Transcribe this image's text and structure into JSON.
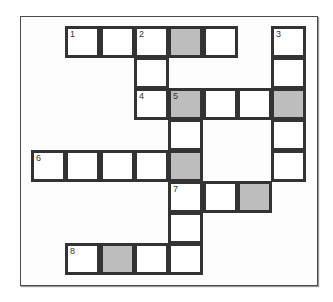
{
  "puzzle": {
    "type": "crossword",
    "colors": {
      "frame_border": "#4a4a4a",
      "cell_border": "#333333",
      "cell_fill": "#ffffff",
      "shaded_fill": "#bdbdbd"
    },
    "grid": {
      "origin_x": 31,
      "origin_y": 26,
      "cell_w": 34.3,
      "cell_h": 31,
      "cells": [
        {
          "row": 0,
          "col": 1,
          "number": "1",
          "shaded": false
        },
        {
          "row": 0,
          "col": 2,
          "number": "",
          "shaded": false
        },
        {
          "row": 0,
          "col": 3,
          "number": "2",
          "shaded": false
        },
        {
          "row": 0,
          "col": 4,
          "number": "",
          "shaded": true
        },
        {
          "row": 0,
          "col": 5,
          "number": "",
          "shaded": false
        },
        {
          "row": 0,
          "col": 7,
          "number": "3",
          "shaded": false
        },
        {
          "row": 1,
          "col": 3,
          "number": "",
          "shaded": false
        },
        {
          "row": 1,
          "col": 7,
          "number": "",
          "shaded": false
        },
        {
          "row": 2,
          "col": 3,
          "number": "4",
          "shaded": false
        },
        {
          "row": 2,
          "col": 4,
          "number": "5",
          "shaded": true
        },
        {
          "row": 2,
          "col": 5,
          "number": "",
          "shaded": false
        },
        {
          "row": 2,
          "col": 6,
          "number": "",
          "shaded": false
        },
        {
          "row": 2,
          "col": 7,
          "number": "",
          "shaded": true
        },
        {
          "row": 3,
          "col": 4,
          "number": "",
          "shaded": false
        },
        {
          "row": 3,
          "col": 7,
          "number": "",
          "shaded": false
        },
        {
          "row": 4,
          "col": 0,
          "number": "6",
          "shaded": false
        },
        {
          "row": 4,
          "col": 1,
          "number": "",
          "shaded": false
        },
        {
          "row": 4,
          "col": 2,
          "number": "",
          "shaded": false
        },
        {
          "row": 4,
          "col": 3,
          "number": "",
          "shaded": false
        },
        {
          "row": 4,
          "col": 4,
          "number": "",
          "shaded": true
        },
        {
          "row": 4,
          "col": 7,
          "number": "",
          "shaded": false
        },
        {
          "row": 5,
          "col": 4,
          "number": "7",
          "shaded": false
        },
        {
          "row": 5,
          "col": 5,
          "number": "",
          "shaded": false
        },
        {
          "row": 5,
          "col": 6,
          "number": "",
          "shaded": true
        },
        {
          "row": 6,
          "col": 4,
          "number": "",
          "shaded": false
        },
        {
          "row": 7,
          "col": 1,
          "number": "8",
          "shaded": false
        },
        {
          "row": 7,
          "col": 2,
          "number": "",
          "shaded": true
        },
        {
          "row": 7,
          "col": 3,
          "number": "",
          "shaded": false
        },
        {
          "row": 7,
          "col": 4,
          "number": "",
          "shaded": false
        }
      ]
    }
  }
}
